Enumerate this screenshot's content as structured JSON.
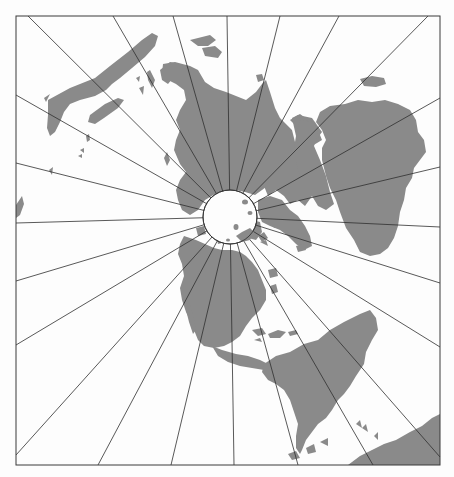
{
  "map": {
    "type": "polar-azimuthal-projection",
    "center": {
      "x": 230,
      "y": 217
    },
    "pole_radius": 27,
    "frame": {
      "left": 16,
      "top": 16,
      "right": 440,
      "bottom": 465
    },
    "colors": {
      "land": "#8a8a8a",
      "ocean": "#fdfdfd",
      "grid_lines": "#2e2e2e"
    },
    "meridian_endpoints": [
      {
        "edge": "top",
        "x": 28,
        "y": 16
      },
      {
        "edge": "top",
        "x": 113,
        "y": 16
      },
      {
        "edge": "top",
        "x": 173,
        "y": 16
      },
      {
        "edge": "top",
        "x": 227,
        "y": 16
      },
      {
        "edge": "top",
        "x": 280,
        "y": 16
      },
      {
        "edge": "top",
        "x": 339,
        "y": 16
      },
      {
        "edge": "top",
        "x": 428,
        "y": 16
      },
      {
        "edge": "right",
        "x": 440,
        "y": 98
      },
      {
        "edge": "right",
        "x": 440,
        "y": 167
      },
      {
        "edge": "right",
        "x": 440,
        "y": 227
      },
      {
        "edge": "right",
        "x": 440,
        "y": 283
      },
      {
        "edge": "right",
        "x": 440,
        "y": 347
      },
      {
        "edge": "right",
        "x": 440,
        "y": 457
      },
      {
        "edge": "bottom",
        "x": 373,
        "y": 465
      },
      {
        "edge": "bottom",
        "x": 298,
        "y": 465
      },
      {
        "edge": "bottom",
        "x": 234,
        "y": 465
      },
      {
        "edge": "bottom",
        "x": 171,
        "y": 465
      },
      {
        "edge": "bottom",
        "x": 98,
        "y": 465
      },
      {
        "edge": "left",
        "x": 16,
        "y": 455
      },
      {
        "edge": "left",
        "x": 16,
        "y": 345
      },
      {
        "edge": "left",
        "x": 16,
        "y": 281
      },
      {
        "edge": "left",
        "x": 16,
        "y": 223
      },
      {
        "edge": "left",
        "x": 16,
        "y": 163
      },
      {
        "edge": "left",
        "x": 16,
        "y": 95
      }
    ],
    "landmasses": [
      "australia",
      "asia",
      "europe",
      "africa",
      "arabia",
      "north-america",
      "south-america",
      "antarctica",
      "greenland"
    ]
  }
}
